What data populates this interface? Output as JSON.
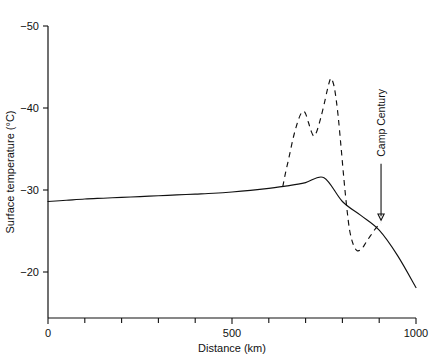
{
  "chart_data": {
    "type": "line",
    "title": "",
    "xlabel": "Distance (km)",
    "ylabel": "Surface temperature (°C)",
    "xlim": [
      0,
      1000
    ],
    "ylim": [
      -50,
      -18
    ],
    "y_axis_inverted": true,
    "grid": false,
    "legend_position": "none",
    "x_ticks": [
      0,
      100,
      200,
      300,
      400,
      500,
      600,
      700,
      800,
      900,
      1000
    ],
    "x_tick_labels": [
      "0",
      "",
      "",
      "",
      "",
      "500",
      "",
      "",
      "",
      "",
      "1000"
    ],
    "y_ticks": [
      -50,
      -40,
      -30,
      -20
    ],
    "y_tick_labels": [
      "−50",
      "−40",
      "−30",
      "−20"
    ],
    "series": [
      {
        "name": "Steady-state surface temperature profile",
        "style": "solid",
        "points": [
          [
            0,
            -28.6
          ],
          [
            50,
            -28.75
          ],
          [
            100,
            -28.9
          ],
          [
            150,
            -29.0
          ],
          [
            200,
            -29.1
          ],
          [
            250,
            -29.2
          ],
          [
            300,
            -29.3
          ],
          [
            350,
            -29.4
          ],
          [
            400,
            -29.5
          ],
          [
            450,
            -29.6
          ],
          [
            500,
            -29.75
          ],
          [
            550,
            -29.95
          ],
          [
            600,
            -30.2
          ],
          [
            650,
            -30.5
          ],
          [
            700,
            -30.9
          ],
          [
            750,
            -31.5
          ],
          [
            800,
            -28.6
          ],
          [
            850,
            -26.9
          ],
          [
            900,
            -25.1
          ],
          [
            950,
            -22.0
          ],
          [
            1000,
            -18.1
          ]
        ]
      },
      {
        "name": "Measured temperature profile",
        "style": "dashed",
        "points": [
          [
            638,
            -30.4
          ],
          [
            645,
            -32.0
          ],
          [
            655,
            -34.0
          ],
          [
            665,
            -36.1
          ],
          [
            675,
            -37.8
          ],
          [
            685,
            -39.1
          ],
          [
            693,
            -39.6
          ],
          [
            700,
            -39.3
          ],
          [
            708,
            -38.2
          ],
          [
            715,
            -37.2
          ],
          [
            722,
            -36.6
          ],
          [
            730,
            -37.1
          ],
          [
            740,
            -38.6
          ],
          [
            750,
            -40.4
          ],
          [
            760,
            -42.4
          ],
          [
            768,
            -43.6
          ],
          [
            774,
            -43.2
          ],
          [
            780,
            -42.0
          ],
          [
            788,
            -39.2
          ],
          [
            796,
            -35.4
          ],
          [
            804,
            -31.4
          ],
          [
            812,
            -27.8
          ],
          [
            820,
            -25.0
          ],
          [
            830,
            -23.3
          ],
          [
            840,
            -22.6
          ],
          [
            852,
            -22.8
          ],
          [
            864,
            -23.6
          ],
          [
            876,
            -24.4
          ],
          [
            890,
            -25.3
          ],
          [
            905,
            -26.0
          ]
        ]
      }
    ],
    "annotations": [
      {
        "text": "Camp Century",
        "rotation": -90,
        "arrow_from": [
          905,
          -33.2
        ],
        "arrow_to": [
          905,
          -26.3
        ]
      }
    ]
  }
}
